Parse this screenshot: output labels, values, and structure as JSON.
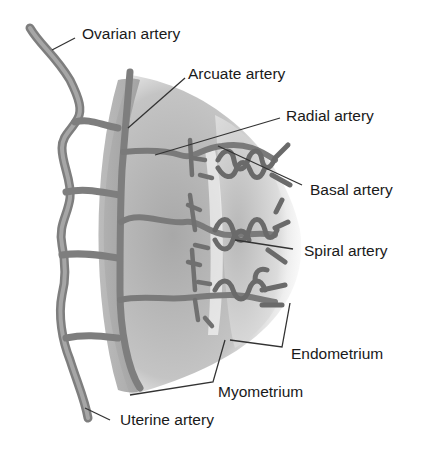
{
  "diagram": {
    "labels": {
      "ovarian_artery": "Ovarian artery",
      "arcuate_artery": "Arcuate artery",
      "radial_artery": "Radial artery",
      "basal_artery": "Basal artery",
      "spiral_artery": "Spiral artery",
      "endometrium": "Endometrium",
      "myometrium": "Myometrium",
      "uterine_artery": "Uterine artery"
    },
    "colors": {
      "vessel": "#8a8a8a",
      "vessel_dark": "#6a6a6a",
      "tissue": "#c8c8c8",
      "leader_line": "#333333",
      "text": "#1a1a1a"
    }
  }
}
